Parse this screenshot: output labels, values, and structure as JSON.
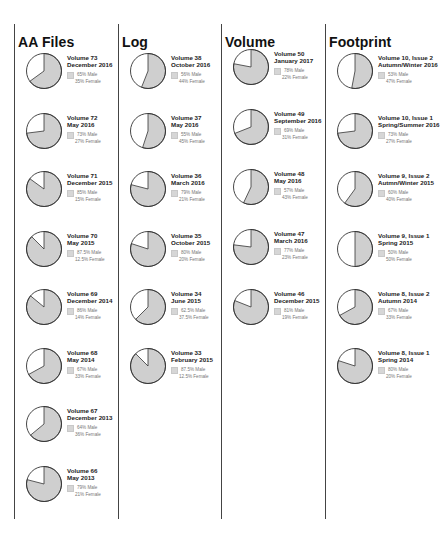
{
  "colors": {
    "male": "#cfcfcf",
    "female": "#ffffff",
    "outline": "#333333",
    "divider": "#444444"
  },
  "legend": {
    "male_suffix": "Male",
    "female_suffix": "Female"
  },
  "columns": [
    {
      "title": "AA Files",
      "items": [
        {
          "volume": "Volume 73",
          "date": "December 2016",
          "male_label": "65% Male",
          "female_label": "35% Female",
          "male": 65
        },
        {
          "volume": "Volume 72",
          "date": "May 2016",
          "male_label": "73% Male",
          "female_label": "27% Female",
          "male": 73
        },
        {
          "volume": "Volume 71",
          "date": "December 2015",
          "male_label": "85% Male",
          "female_label": "15% Female",
          "male": 85
        },
        {
          "volume": "Volume 70",
          "date": "May 2015",
          "male_label": "87.5% Male",
          "female_label": "12.5% Female",
          "male": 87.5
        },
        {
          "volume": "Volume 69",
          "date": "December 2014",
          "male_label": "86% Male",
          "female_label": "14% Female",
          "male": 86
        },
        {
          "volume": "Volume 68",
          "date": "May 2014",
          "male_label": "67% Male",
          "female_label": "33% Female",
          "male": 67
        },
        {
          "volume": "Volume 67",
          "date": "December 2013",
          "male_label": "64% Male",
          "female_label": "36% Female",
          "male": 64
        },
        {
          "volume": "Volume 66",
          "date": "May 2013",
          "male_label": "79% Male",
          "female_label": "21% Female",
          "male": 79
        }
      ]
    },
    {
      "title": "Log",
      "items": [
        {
          "volume": "Volume 38",
          "date": "October 2016",
          "male_label": "56% Male",
          "female_label": "44% Female",
          "male": 56
        },
        {
          "volume": "Volume 37",
          "date": "May 2016",
          "male_label": "55% Male",
          "female_label": "45% Female",
          "male": 55
        },
        {
          "volume": "Volume 36",
          "date": "March 2016",
          "male_label": "79% Male",
          "female_label": "21% Female",
          "male": 79
        },
        {
          "volume": "Volume 35",
          "date": "October 2015",
          "male_label": "80% Male",
          "female_label": "20% Female",
          "male": 80
        },
        {
          "volume": "Volume 34",
          "date": "June 2015",
          "male_label": "62.5% Male",
          "female_label": "37.5% Female",
          "male": 62.5
        },
        {
          "volume": "Volume 33",
          "date": "February 2015",
          "male_label": "87.5% Male",
          "female_label": "12.5% Female",
          "male": 87.5
        }
      ]
    },
    {
      "title": "Volume",
      "items": [
        {
          "volume": "Volume 50",
          "date": "January 2017",
          "male_label": "78% Male",
          "female_label": "22% Female",
          "male": 78
        },
        {
          "volume": "Volume 49",
          "date": "September 2016",
          "male_label": "69% Male",
          "female_label": "31% Female",
          "male": 69
        },
        {
          "volume": "Volume 48",
          "date": "May 2016",
          "male_label": "57% Male",
          "female_label": "43% Female",
          "male": 57
        },
        {
          "volume": "Volume 47",
          "date": "March 2016",
          "male_label": "77% Male",
          "female_label": "23% Female",
          "male": 77
        },
        {
          "volume": "Volume 46",
          "date": "December 2015",
          "male_label": "81% Male",
          "female_label": "19% Female",
          "male": 81
        }
      ]
    },
    {
      "title": "Footprint",
      "items": [
        {
          "volume": "Volume 10, Issue 2",
          "date": "Autumn/Winter 2016",
          "male_label": "53% Male",
          "female_label": "47% Female",
          "male": 53
        },
        {
          "volume": "Volume 10, Issue 1",
          "date": "Spring/Summer 2016",
          "male_label": "73% Male",
          "female_label": "27% Female",
          "male": 73
        },
        {
          "volume": "Volume 9, Issue 2",
          "date": "Autmn/Winter 2015",
          "male_label": "60% Male",
          "female_label": "40% Female",
          "male": 60
        },
        {
          "volume": "Volume 9, Issue 1",
          "date": "Spring 2015",
          "male_label": "50% Male",
          "female_label": "50% Female",
          "male": 50
        },
        {
          "volume": "Volume 8, Issue 2",
          "date": "Autumn 2014",
          "male_label": "67% Male",
          "female_label": "33% Female",
          "male": 67
        },
        {
          "volume": "Volume 8, Issue 1",
          "date": "Spring 2014",
          "male_label": "80% Male",
          "female_label": "20% Female",
          "male": 80
        }
      ]
    }
  ],
  "chart_data": {
    "type": "pie",
    "title": "",
    "series_names": [
      "Male",
      "Female"
    ],
    "groups": [
      {
        "publication": "AA Files",
        "categories": [
          "Volume 73 December 2016",
          "Volume 72 May 2016",
          "Volume 71 December 2015",
          "Volume 70 May 2015",
          "Volume 69 December 2014",
          "Volume 68 May 2014",
          "Volume 67 December 2013",
          "Volume 66 May 2013"
        ],
        "male": [
          65,
          73,
          85,
          87.5,
          86,
          67,
          64,
          79
        ],
        "female": [
          35,
          27,
          15,
          12.5,
          14,
          33,
          36,
          21
        ]
      },
      {
        "publication": "Log",
        "categories": [
          "Volume 38 October 2016",
          "Volume 37 May 2016",
          "Volume 36 March 2016",
          "Volume 35 October 2015",
          "Volume 34 June 2015",
          "Volume 33 February 2015"
        ],
        "male": [
          56,
          55,
          79,
          80,
          62.5,
          87.5
        ],
        "female": [
          44,
          45,
          21,
          20,
          37.5,
          12.5
        ]
      },
      {
        "publication": "Volume",
        "categories": [
          "Volume 50 January 2017",
          "Volume 49 September 2016",
          "Volume 48 May 2016",
          "Volume 47 March 2016",
          "Volume 46 December 2015"
        ],
        "male": [
          78,
          69,
          57,
          77,
          81
        ],
        "female": [
          22,
          31,
          43,
          23,
          19
        ]
      },
      {
        "publication": "Footprint",
        "categories": [
          "Volume 10, Issue 2 Autumn/Winter 2016",
          "Volume 10, Issue 1 Spring/Summer 2016",
          "Volume 9, Issue 2 Autmn/Winter 2015",
          "Volume 9, Issue 1 Spring 2015",
          "Volume 8, Issue 2 Autumn 2014",
          "Volume 8, Issue 1 Spring 2014"
        ],
        "male": [
          53,
          73,
          60,
          50,
          67,
          80
        ],
        "female": [
          47,
          27,
          40,
          50,
          33,
          20
        ]
      }
    ],
    "legend_position": "right of each pie",
    "grid": false
  }
}
